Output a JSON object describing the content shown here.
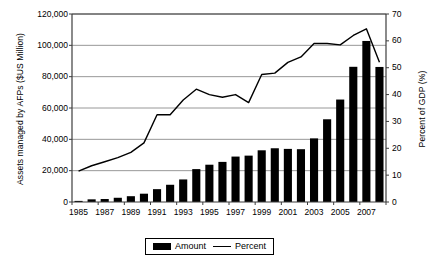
{
  "chart_data": {
    "type": "bar",
    "title": "",
    "subtitle": "",
    "xlabel": "",
    "ylabel": "Assets managed by AFPs ($US Million)",
    "y2label": "Percent of GDP (%)",
    "grid": true,
    "legend_position": "bottom",
    "ylim": [
      0,
      120000
    ],
    "y2lim": [
      0,
      70
    ],
    "ytick_labels": [
      "120,000",
      "100,000",
      "80,000",
      "60,000",
      "40,000",
      "20,000",
      "0"
    ],
    "ytick_values": [
      120000,
      100000,
      80000,
      60000,
      40000,
      20000,
      0
    ],
    "y2tick_labels": [
      "70",
      "60",
      "50",
      "40",
      "30",
      "20",
      "10",
      "0"
    ],
    "y2tick_values": [
      70,
      60,
      50,
      40,
      30,
      20,
      10,
      0
    ],
    "categories": [
      "1985",
      "1986",
      "1987",
      "1988",
      "1989",
      "1990",
      "1991",
      "1992",
      "1993",
      "1994",
      "1995",
      "1996",
      "1997",
      "1998",
      "1999",
      "2000",
      "2001",
      "2002",
      "2003",
      "2004",
      "2005",
      "2006",
      "2007",
      "2008"
    ],
    "xtick_labels": [
      "1985",
      "1987",
      "1989",
      "1991",
      "1993",
      "1995",
      "1997",
      "1999",
      "2001",
      "2003",
      "2005",
      "2007"
    ],
    "series": [
      {
        "name": "Amount",
        "type": "bar",
        "axis": "left",
        "unit": "$US Million",
        "color": "#000000",
        "values": [
          700,
          1700,
          1900,
          2700,
          3700,
          5300,
          8200,
          11000,
          14400,
          21000,
          23800,
          25600,
          29000,
          29600,
          33000,
          34300,
          33900,
          33700,
          40600,
          52800,
          65400,
          86300,
          102800,
          86200
        ]
      },
      {
        "name": "Percent",
        "type": "line",
        "axis": "right",
        "unit": "%",
        "color": "#000000",
        "values": [
          11.5,
          13.5,
          15.0,
          16.5,
          18.5,
          22.0,
          32.5,
          32.5,
          38.0,
          42.0,
          40.0,
          39.0,
          40.0,
          37.0,
          47.5,
          48.0,
          52.0,
          54.0,
          59.0,
          59.0,
          58.5,
          62.0,
          64.5,
          52.0
        ]
      }
    ]
  },
  "legend": {
    "entries": [
      {
        "label": "Amount",
        "marker": "bar-swatch"
      },
      {
        "label": "Percent",
        "marker": "line-swatch"
      }
    ]
  }
}
